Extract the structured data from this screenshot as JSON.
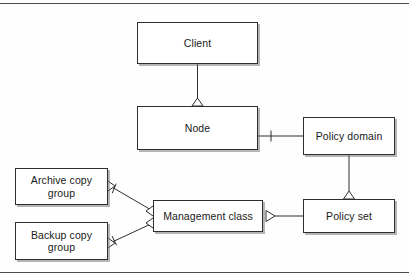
{
  "figure": {
    "kind": "uml-class-diagram",
    "width": 409,
    "height": 278,
    "line_color": "#2e2e2e",
    "box_fill": "#ffffff",
    "background": "#fefefe",
    "rule_color": "#4a4a4a"
  },
  "nodes": {
    "client": {
      "label": "Client"
    },
    "node": {
      "label": "Node"
    },
    "policy_domain": {
      "label": "Policy domain"
    },
    "policy_set": {
      "label": "Policy set"
    },
    "management_class": {
      "label": "Management class"
    },
    "archive_copy_group": {
      "label": "Archive copy\ngroup"
    },
    "backup_copy_group": {
      "label": "Backup copy\ngroup"
    }
  },
  "connectors": [
    {
      "id": "client-node",
      "from": "client",
      "to": "node",
      "style": "generalization",
      "arrow": "hollow-triangle-up"
    },
    {
      "id": "node-policy-domain",
      "from": "node",
      "to": "policy_domain",
      "style": "association",
      "arrow": "tick"
    },
    {
      "id": "policy-domain-policy-set",
      "from": "policy_domain",
      "to": "policy_set",
      "style": "generalization",
      "arrow": "hollow-triangle-up"
    },
    {
      "id": "mgmt-class-policy-set",
      "from": "management_class",
      "to": "policy_set",
      "style": "generalization",
      "arrow": "hollow-triangle-right"
    },
    {
      "id": "archive-mgmt-class",
      "from": "archive_copy_group",
      "to": "management_class",
      "style": "association",
      "arrow": "tick"
    },
    {
      "id": "backup-mgmt-class",
      "from": "backup_copy_group",
      "to": "management_class",
      "style": "association",
      "arrow": "tick"
    }
  ]
}
